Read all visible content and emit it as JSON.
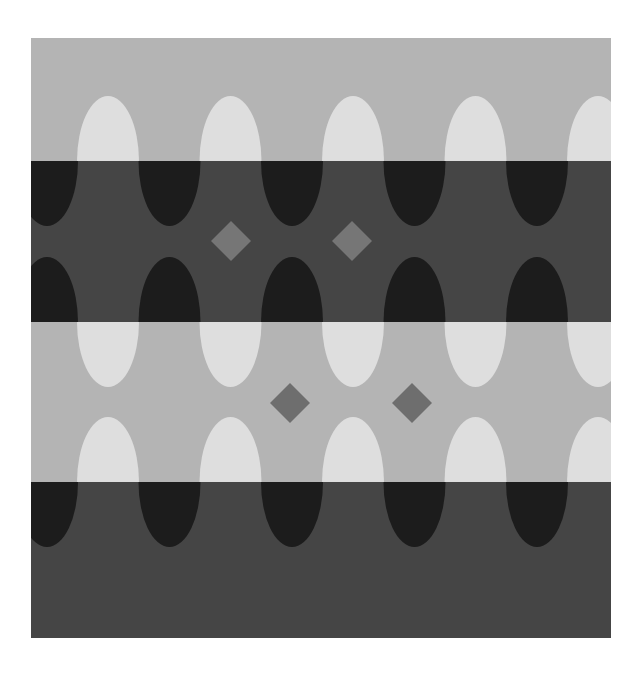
{
  "figure": {
    "title": "Lightness illusion: gray diamonds on banded background with lobes",
    "frame": {
      "x": 31,
      "y": 38,
      "width": 580,
      "height": 600
    },
    "colors": {
      "page": "#ffffff",
      "light_band": "#b4b4b4",
      "dark_band": "#454545",
      "white_lobe": "#dedede",
      "black_lobe": "#1c1c1c",
      "diamond_on_dark": "#767676",
      "diamond_on_light": "#6e6e6e"
    },
    "bands": [
      {
        "id": "band-1",
        "tone": "light",
        "y0": 38,
        "y1": 161
      },
      {
        "id": "band-2",
        "tone": "dark",
        "y0": 161,
        "y1": 322
      },
      {
        "id": "band-3",
        "tone": "light",
        "y0": 322,
        "y1": 482
      },
      {
        "id": "band-4",
        "tone": "dark",
        "y0": 482,
        "y1": 638
      }
    ],
    "lobe": {
      "rx": 31,
      "ry": 65
    },
    "white_lobe_centers_x": [
      108,
      230.5,
      353,
      475.5,
      598
    ],
    "black_lobe_centers_x": [
      47,
      169.5,
      292,
      414.5,
      537
    ],
    "white_lobe_edges_y": [
      {
        "y": 161,
        "dir": "up"
      },
      {
        "y": 322,
        "dir": "down"
      },
      {
        "y": 482,
        "dir": "up"
      }
    ],
    "black_lobe_edges_y": [
      {
        "y": 161,
        "dir": "down"
      },
      {
        "y": 322,
        "dir": "up"
      },
      {
        "y": 482,
        "dir": "down"
      }
    ],
    "diamonds": [
      {
        "cx": 231,
        "cy": 241,
        "r": 20,
        "on": "dark"
      },
      {
        "cx": 352,
        "cy": 241,
        "r": 20,
        "on": "dark"
      },
      {
        "cx": 290,
        "cy": 403,
        "r": 20,
        "on": "light"
      },
      {
        "cx": 412,
        "cy": 403,
        "r": 20,
        "on": "light"
      }
    ]
  }
}
